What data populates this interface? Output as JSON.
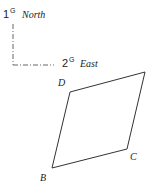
{
  "axes": {
    "north": {
      "number": "1",
      "superscript": "G",
      "label": "North"
    },
    "east": {
      "number": "2",
      "superscript": "G",
      "label": "East"
    }
  },
  "shape": {
    "type": "quadrilateral",
    "vertices": [
      {
        "name": "D",
        "x": 70,
        "y": 92
      },
      {
        "name": "",
        "x": 145,
        "y": 72
      },
      {
        "name": "C",
        "x": 127,
        "y": 149
      },
      {
        "name": "B",
        "x": 52,
        "y": 168
      }
    ]
  },
  "labels": {
    "D": "D",
    "C": "C",
    "B": "B"
  },
  "colors": {
    "stroke": "#333333",
    "axis": "#555555"
  }
}
